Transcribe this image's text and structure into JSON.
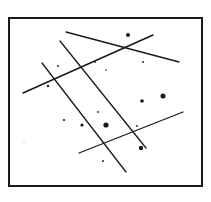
{
  "canvas": {
    "width": 211,
    "height": 202,
    "background": "#ffffff",
    "ink": "#1a1a1a"
  },
  "frame": {
    "x": 9,
    "y": 18,
    "width": 193,
    "height": 168,
    "stroke_width": 2
  },
  "lines": [
    {
      "id": "top-descending-line",
      "x1": 66,
      "y1": 32,
      "x2": 179,
      "y2": 62,
      "w": 1.3
    },
    {
      "id": "upper-ascending-line",
      "x1": 23,
      "y1": 93,
      "x2": 153,
      "y2": 35,
      "w": 1.5
    },
    {
      "id": "left-diagonal-line",
      "x1": 42,
      "y1": 63,
      "x2": 126,
      "y2": 172,
      "w": 1.3
    },
    {
      "id": "right-diagonal-line",
      "x1": 60,
      "y1": 41,
      "x2": 146,
      "y2": 148,
      "w": 1.3
    },
    {
      "id": "lower-ascending-line",
      "x1": 79,
      "y1": 153,
      "x2": 183,
      "y2": 112,
      "w": 1.3
    }
  ],
  "dots": [
    {
      "x": 128,
      "y": 35,
      "r": 2.0
    },
    {
      "x": 143,
      "y": 62,
      "r": 0.9
    },
    {
      "x": 58,
      "y": 66,
      "r": 0.9
    },
    {
      "x": 95,
      "y": 62,
      "r": 0.9
    },
    {
      "x": 106,
      "y": 70,
      "r": 0.8
    },
    {
      "x": 48,
      "y": 86,
      "r": 1.2
    },
    {
      "x": 163,
      "y": 96,
      "r": 2.5
    },
    {
      "x": 142,
      "y": 101,
      "r": 1.8
    },
    {
      "x": 98,
      "y": 112,
      "r": 0.9
    },
    {
      "x": 64,
      "y": 120,
      "r": 1.1
    },
    {
      "x": 82,
      "y": 125,
      "r": 1.6
    },
    {
      "x": 106,
      "y": 125,
      "r": 2.6
    },
    {
      "x": 137,
      "y": 126,
      "r": 0.9
    },
    {
      "x": 141,
      "y": 148,
      "r": 2.2
    },
    {
      "x": 103,
      "y": 161,
      "r": 1.0
    },
    {
      "x": 24,
      "y": 142,
      "r": 0.6,
      "faint": true
    }
  ]
}
